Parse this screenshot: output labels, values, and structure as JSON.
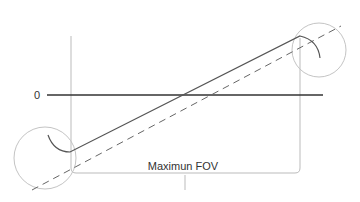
{
  "diagram": {
    "zero_label": "0",
    "fov_label": "Maximun FOV",
    "colors": {
      "axis": "#333333",
      "frame": "#bbbbbb",
      "circle": "#c4c4c4",
      "solid_line": "#555555",
      "dashed_line": "#666666",
      "text": "#333333"
    }
  }
}
